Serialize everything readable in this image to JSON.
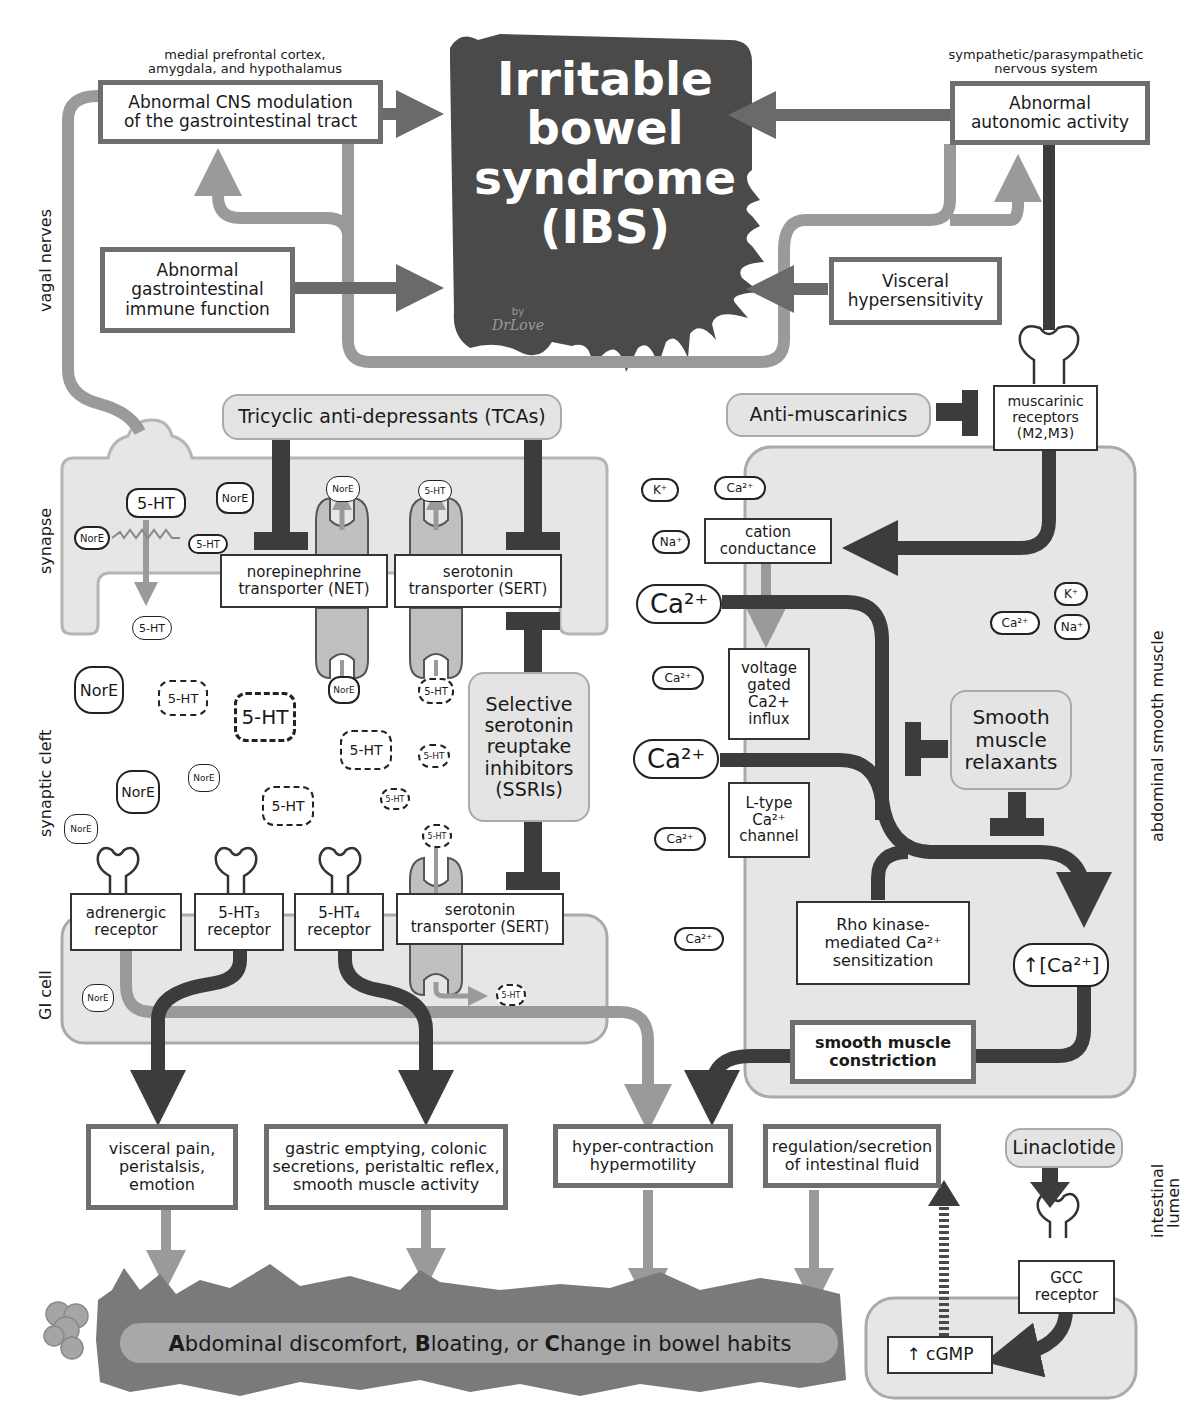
{
  "center": {
    "title_lines": [
      "Irritable",
      "bowel",
      "syndrome",
      "(IBS)"
    ],
    "signature_by": "by",
    "signature_name": "DrLove"
  },
  "top_left": {
    "caption": "medial prefrontal cortex, amygdala, and hypothalamus",
    "caption_line1": "medial prefrontal cortex,",
    "caption_line2": "amygdala, and hypothalamus",
    "box_line1": "Abnormal CNS modulation",
    "box_line2": "of the gastrointestinal tract"
  },
  "top_right": {
    "caption_line1": "sympathetic/parasympathetic",
    "caption_line2": "nervous system",
    "box_line1": "Abnormal",
    "box_line2": "autonomic activity"
  },
  "immune": {
    "line1": "Abnormal",
    "line2": "gastrointestinal",
    "line3": "immune function"
  },
  "visceral": {
    "line1": "Visceral",
    "line2": "hypersensitivity"
  },
  "side_labels": {
    "vagal": "vagal nerves",
    "synapse": "synapse",
    "cleft": "synaptic cleft",
    "gicell": "GI cell",
    "muscle": "abdominal smooth muscle",
    "lumen_line1": "intestinal",
    "lumen_line2": "lumen"
  },
  "drugs": {
    "tca": "Tricyclic anti-depressants (TCAs)",
    "antimuscarinics": "Anti-muscarinics",
    "ssri_lines": [
      "Selective",
      "serotonin",
      "reuptake",
      "inhibitors",
      "(SSRIs)"
    ],
    "relaxant_lines": [
      "Smooth",
      "muscle",
      "relaxants"
    ],
    "linaclotide": "Linaclotide"
  },
  "transporters": {
    "net_line1": "norepinephrine",
    "net_line2": "transporter (NET)",
    "sert_line1": "serotonin",
    "sert_line2": "transporter (SERT)"
  },
  "muscarinic": {
    "line1": "muscarinic",
    "line2": "receptors",
    "line3": "(M2,M3)"
  },
  "receptors": {
    "adrenergic_line1": "adrenergic",
    "adrenergic_line2": "receptor",
    "ht3_line1": "5-HT₃",
    "ht3_line2": "receptor",
    "ht4_line1": "5-HT₄",
    "ht4_line2": "receptor",
    "sert_line1": "serotonin",
    "sert_line2": "transporter (SERT)"
  },
  "muscle_pathway": {
    "cation_line1": "cation",
    "cation_line2": "conductance",
    "vgc_lines": [
      "voltage",
      "gated",
      "Ca2+",
      "influx"
    ],
    "ltype_lines": [
      "L-type",
      "Ca²⁺",
      "channel"
    ],
    "rho_line1": "Rho kinase-",
    "rho_line2": "mediated Ca²⁺",
    "rho_line3": "sensitization",
    "ca_increase": "↑[Ca²⁺]",
    "constriction_line1": "smooth muscle",
    "constriction_line2": "constriction"
  },
  "ions": {
    "ca": "Ca²⁺",
    "k": "K⁺",
    "na": "Na⁺",
    "ht": "5-HT",
    "nore": "NorE"
  },
  "outcomes": {
    "visceral_lines": [
      "visceral pain,",
      "peristalsis,",
      "emotion"
    ],
    "gastric_lines": [
      "gastric emptying, colonic",
      "secretions, peristaltic reflex,",
      "smooth muscle activity"
    ],
    "hyper_lines": [
      "hyper-contraction",
      "hypermotility"
    ],
    "fluid_lines": [
      "regulation/secretion",
      "of intestinal fluid"
    ]
  },
  "lumen": {
    "gcc_line1": "GCC",
    "gcc_line2": "receptor",
    "cgmp": "↑ cGMP"
  },
  "symptom_bar": {
    "a": "A",
    "a_rest": "bdominal discomfort, ",
    "b": "B",
    "b_rest": "loating, or ",
    "c": "C",
    "c_rest": "hange in bowel habits"
  },
  "colors": {
    "dark": "#4a4a4a",
    "mid_gray": "#8c8c8c",
    "light_gray": "#e6e6e6",
    "box_border": "#6e6e6e"
  }
}
